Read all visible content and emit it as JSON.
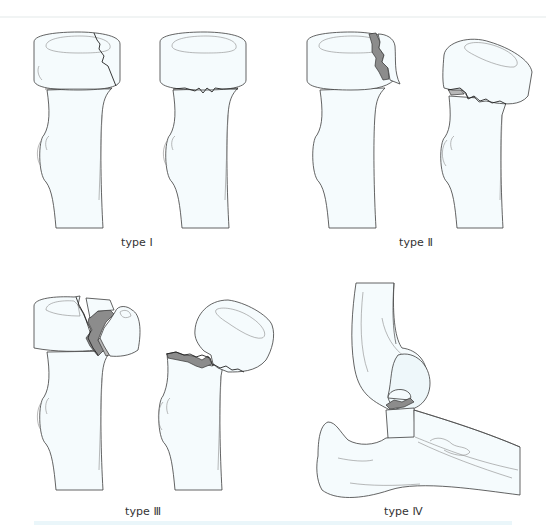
{
  "figure": {
    "panels": [
      {
        "id": "type1",
        "label": "type Ⅰ",
        "description": "Fracture line through epiphysis (left) and separation along physis (right)"
      },
      {
        "id": "type2",
        "label": "type Ⅱ",
        "description": "Physeal separation with metaphyseal fragment, tilted epiphysis"
      },
      {
        "id": "type3",
        "label": "type Ⅲ",
        "description": "Intra-articular epiphyseal fracture, displaced head fragment"
      },
      {
        "id": "type4",
        "label": "type Ⅳ",
        "description": "Lateral elbow view with radial head fracture against capitellum"
      }
    ]
  },
  "colors": {
    "background": "#ffffff",
    "bone_fill": "#f5fbfd",
    "outline": "#3c3c3c",
    "fracture_shade": "#8c8c8c",
    "border_accent": "#eaf6fa"
  }
}
